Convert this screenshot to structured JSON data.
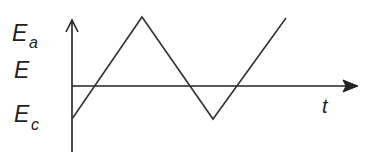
{
  "diagram": {
    "type": "triangular-waveform",
    "y_axis": {
      "label_main": "E",
      "levels": [
        {
          "name": "anodic-limit",
          "main": "E",
          "sub": "a"
        },
        {
          "name": "potential",
          "main": "E",
          "sub": ""
        },
        {
          "name": "cathodic-limit",
          "main": "E",
          "sub": "c"
        }
      ]
    },
    "x_axis": {
      "label": "t"
    },
    "waveform": {
      "sequence": [
        "Ec",
        "Ea",
        "Ec",
        "Ea"
      ],
      "note": "Starts at Ec, rises linearly to Ea, falls linearly to Ec, rises again toward Ea"
    },
    "colors": {
      "line": "#333333",
      "text": "#222222",
      "background": "#ffffff"
    }
  }
}
